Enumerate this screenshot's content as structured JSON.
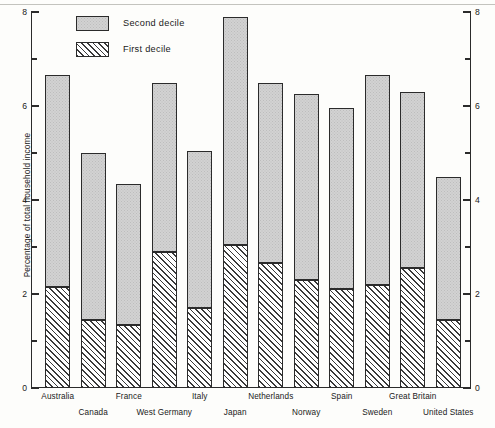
{
  "chart_data": {
    "type": "bar",
    "subtype": "stacked",
    "title": "",
    "xlabel": "",
    "ylabel": "Percentage of total household income",
    "ylim": [
      0,
      8
    ],
    "ytick_labels": [
      "0",
      "2",
      "4",
      "6",
      "8"
    ],
    "ytick_values": [
      0,
      2,
      4,
      6,
      8
    ],
    "minor_ytick_values": [
      1,
      3,
      5,
      7
    ],
    "grid": false,
    "legend_position": "top-left",
    "right_axis_mirrors_left": true,
    "categories": [
      "Australia",
      "Canada",
      "France",
      "West Germany",
      "Italy",
      "Japan",
      "Netherlands",
      "Norway",
      "Spain",
      "Sweden",
      "Great Britain",
      "United States"
    ],
    "series": [
      {
        "name": "First decile",
        "fill": "diagonal-hatch",
        "values": [
          2.15,
          1.45,
          1.35,
          2.9,
          1.7,
          3.05,
          2.65,
          2.3,
          2.1,
          2.2,
          2.55,
          1.45
        ]
      },
      {
        "name": "Second decile",
        "fill": "gray-stipple",
        "values": [
          4.5,
          3.55,
          3.0,
          3.6,
          3.35,
          4.85,
          3.85,
          3.95,
          3.85,
          4.45,
          3.75,
          3.05
        ]
      }
    ],
    "totals": [
      6.65,
      5.0,
      4.35,
      6.5,
      5.05,
      7.9,
      6.5,
      6.25,
      5.95,
      6.65,
      6.3,
      4.5
    ]
  },
  "legend": {
    "items": [
      {
        "label": "Second decile",
        "swatch": "gray-stipple"
      },
      {
        "label": "First decile",
        "swatch": "diagonal-hatch"
      }
    ]
  },
  "colors": {
    "axis": "#2b2b2b",
    "second_decile_fill": "#d2d2d2",
    "first_decile_hatch": "#3a3a3a",
    "background": "#fdfdfb",
    "text": "#1a1a1a"
  }
}
